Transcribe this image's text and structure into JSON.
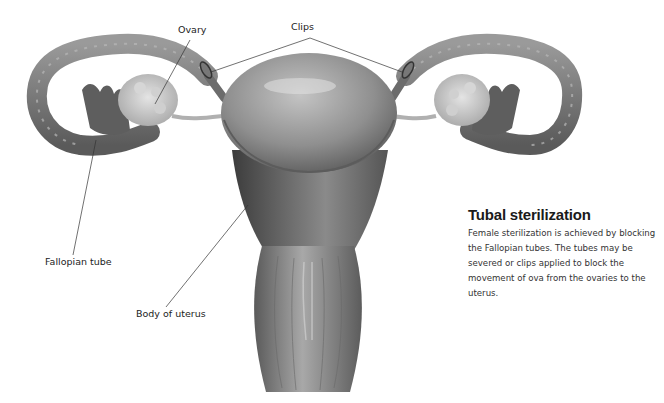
{
  "diagram": {
    "labels": {
      "ovary": "Ovary",
      "clips": "Clips",
      "fallopian_tube": "Fallopian tube",
      "body_of_uterus": "Body of uterus"
    }
  },
  "caption": {
    "title": "Tubal sterilization",
    "body": "Female sterilization is achieved by blocking the Fallopian tubes. The tubes may be severed or clips applied to block the movement of ova from the ovaries to the uterus."
  },
  "colors": {
    "background": "#ffffff",
    "organ_mid": "#8a8a8a",
    "organ_dark": "#4a4a4a",
    "organ_light": "#c8c8c8",
    "leader_line": "#333333"
  }
}
